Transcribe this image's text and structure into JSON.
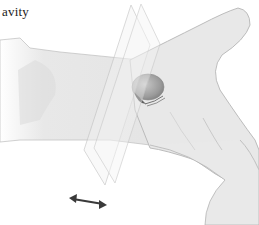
{
  "figure": {
    "label_text": "avity",
    "colors": {
      "skin": "#e6e6e6",
      "skin_shadow": "#cfcfcf",
      "outline": "#b5b5b5",
      "organ": "#a9a9a9",
      "organ_dark": "#6e6e6e",
      "plane": "#f0f0f0",
      "arrow": "#3a3a3a"
    },
    "arrow": {
      "type": "double-headed",
      "direction": "horizontal-diagonal"
    }
  }
}
